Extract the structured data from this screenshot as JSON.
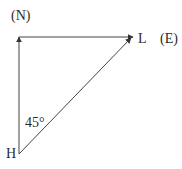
{
  "labels": {
    "north": "(N)",
    "east": "(E)",
    "point_l": "L",
    "point_h": "H",
    "angle": "45°"
  },
  "colors": {
    "line": "#333333",
    "text": "#2a2a2a"
  }
}
